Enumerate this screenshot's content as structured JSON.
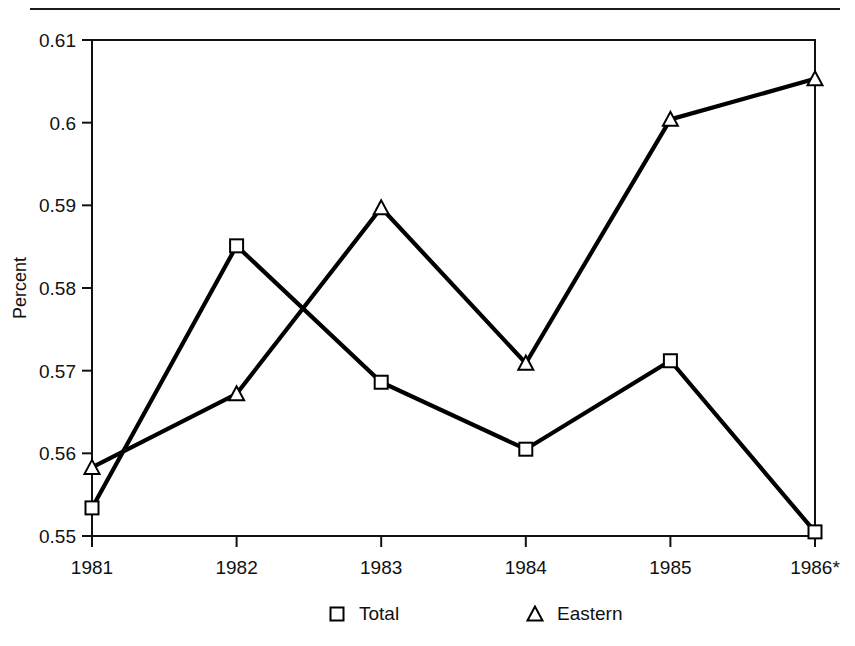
{
  "chart_data": {
    "type": "line",
    "title": "",
    "xlabel": "",
    "ylabel": "Percent",
    "x": [
      "1981",
      "1982",
      "1983",
      "1984",
      "1985",
      "1986*"
    ],
    "categories": [
      "1981",
      "1982",
      "1983",
      "1984",
      "1985",
      "1986*"
    ],
    "xtick_labels": [
      "1981",
      "1982",
      "1983",
      "1984",
      "1985",
      "1986*"
    ],
    "ytick_labels": [
      "0.55",
      "0.56",
      "0.57",
      "0.58",
      "0.59",
      "0.6",
      "0.61"
    ],
    "yticks": [
      0.55,
      0.56,
      0.57,
      0.58,
      0.59,
      0.6,
      0.61
    ],
    "ylim": [
      0.55,
      0.61
    ],
    "grid": false,
    "legend_position": "bottom",
    "series": [
      {
        "name": "Total",
        "marker": "square",
        "color": "#000000",
        "values": [
          0.5534,
          0.5851,
          0.5686,
          0.5605,
          0.5712,
          0.5505
        ]
      },
      {
        "name": "Eastern",
        "marker": "triangle",
        "color": "#000000",
        "values": [
          0.5583,
          0.5672,
          0.5897,
          0.5709,
          0.6004,
          0.6053
        ]
      }
    ]
  },
  "axis": {
    "y_title": "Percent"
  },
  "legend": {
    "items": [
      {
        "label": "Total",
        "marker": "square-marker-icon"
      },
      {
        "label": "Eastern",
        "marker": "triangle-marker-icon"
      }
    ]
  },
  "colors": {
    "ink": "#111111",
    "line": "#000000",
    "background": "#ffffff"
  }
}
